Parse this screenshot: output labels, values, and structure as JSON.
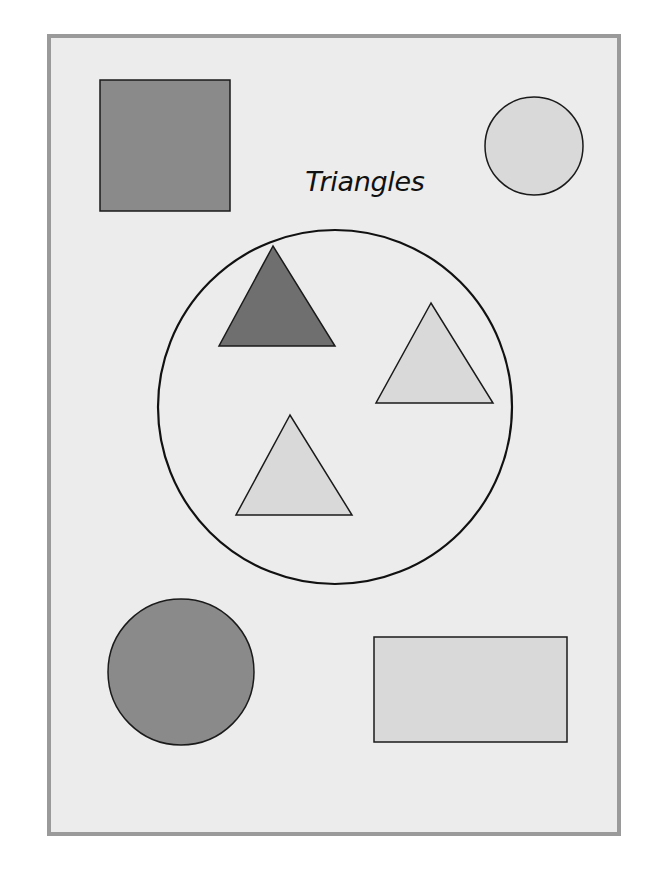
{
  "diagram": {
    "set_label": "Triangles",
    "colors": {
      "background": "#ececec",
      "frame_border": "#9a9a9a",
      "dark_fill": "#8a8a8a",
      "darker_fill": "#6f6f6f",
      "light_fill": "#d9d9d9",
      "stroke": "#1a1a1a"
    },
    "set_circle": {
      "cx": 335,
      "cy": 407,
      "r": 177
    },
    "shapes_inside_set": [
      {
        "type": "triangle",
        "shade": "dark",
        "points": "273,246 219,346 335,346"
      },
      {
        "type": "triangle",
        "shade": "light",
        "points": "431,303 376,403 493,403"
      },
      {
        "type": "triangle",
        "shade": "light",
        "points": "290,415 236,515 352,515"
      }
    ],
    "shapes_outside_set": [
      {
        "type": "square",
        "shade": "dark",
        "x": 100,
        "y": 80,
        "width": 130,
        "height": 131
      },
      {
        "type": "circle",
        "shade": "light",
        "cx": 534,
        "cy": 146,
        "r": 49
      },
      {
        "type": "circle",
        "shade": "dark",
        "cx": 181,
        "cy": 672,
        "r": 73
      },
      {
        "type": "rectangle",
        "shade": "light",
        "x": 374,
        "y": 637,
        "width": 193,
        "height": 105
      }
    ]
  }
}
